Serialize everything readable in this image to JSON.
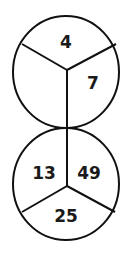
{
  "diagram": {
    "type": "two-circle-number-puzzle",
    "top_circle": {
      "sections": [
        {
          "position": "top",
          "value": "4"
        },
        {
          "position": "right",
          "value": "7"
        },
        {
          "position": "left",
          "value": ""
        }
      ]
    },
    "bottom_circle": {
      "sections": [
        {
          "position": "left",
          "value": "13"
        },
        {
          "position": "right",
          "value": "49"
        },
        {
          "position": "bottom",
          "value": "25"
        }
      ]
    },
    "colors": {
      "line": "#111111",
      "background": "#ffffff"
    }
  }
}
